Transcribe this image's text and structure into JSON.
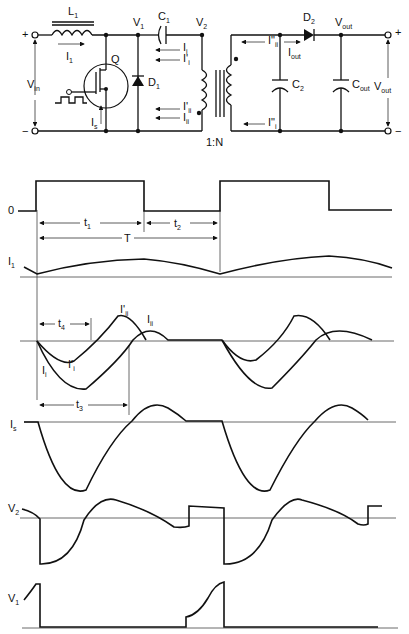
{
  "circuit": {
    "title": "SEPIC/Cuk-type converter with coupled transformer",
    "components": {
      "inductor": "L",
      "inductor_sub": "1",
      "switch": "Q",
      "diode1": "D",
      "diode1_sub": "1",
      "cap1": "C",
      "cap1_sub": "1",
      "cap2": "C",
      "cap2_sub": "2",
      "diode2": "D",
      "diode2_sub": "2",
      "cout": "C",
      "cout_sub": "out",
      "transformer_ratio": "1:N"
    },
    "nodes": {
      "v1": "V",
      "v1_sub": "1",
      "v2": "V",
      "v2_sub": "2",
      "vout": "V",
      "vout_sub": "out",
      "vin": "V",
      "vin_sub": "in",
      "vout_side": "V",
      "vout_side_sub": "out"
    },
    "currents": {
      "i1": "I",
      "i1_sub": "1",
      "is": "I",
      "is_sub": "s",
      "ii": "I",
      "ii_sub": "i",
      "ii_p": "I'",
      "ii_p_sub": "i",
      "iii_p": "I'",
      "iii_p_sub": "ii",
      "iii": "I",
      "iii_sub": "ii",
      "iii_pp": "I\"",
      "iii_pp_sub": "ii",
      "iout": "I",
      "iout_sub": "out",
      "ii_pp": "I\"",
      "ii_pp_sub": "i"
    },
    "terminals": {
      "plus": "+",
      "minus": "−"
    }
  },
  "waveforms": {
    "gate": {
      "zero_label": "0"
    },
    "timing": {
      "t1": "t",
      "t1_sub": "1",
      "t2": "t",
      "t2_sub": "2",
      "T": "T",
      "t3": "t",
      "t3_sub": "3",
      "t4": "t",
      "t4_sub": "4"
    },
    "traces": [
      {
        "name": "I",
        "sub": "1"
      },
      {
        "name": "I'",
        "sub": "ii"
      },
      {
        "name": "I",
        "sub": "ii"
      },
      {
        "name": "I'",
        "sub": "i"
      },
      {
        "name": "I",
        "sub": "i"
      },
      {
        "name": "I",
        "sub": "s"
      },
      {
        "name": "V",
        "sub": "2"
      },
      {
        "name": "V",
        "sub": "1"
      }
    ]
  }
}
